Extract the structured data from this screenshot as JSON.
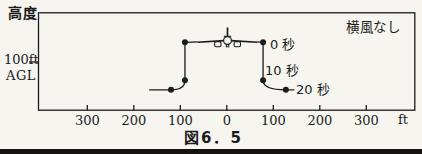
{
  "figure": {
    "caption": "図6．5",
    "y_axis_title": "高度",
    "y_ref_line1": "100ft",
    "y_ref_line2": "AGL",
    "annotation": "横風なし",
    "colors": {
      "ink": "#1c1c1c",
      "paper": "#f6f5f0"
    }
  },
  "chart_data": {
    "type": "line",
    "title": "図6．5",
    "subtitle": "横風なし",
    "ylabel": "高度 100ft AGL",
    "xlabel": "ft",
    "x_unit": "ft",
    "grid": false,
    "x_axis_ticks": [
      {
        "label": "300",
        "ft": -300
      },
      {
        "label": "200",
        "ft": -200
      },
      {
        "label": "100",
        "ft": -100
      },
      {
        "label": "0",
        "ft": 0
      },
      {
        "label": "100",
        "ft": 100
      },
      {
        "label": "200",
        "ft": 200
      },
      {
        "label": "300",
        "ft": 300
      }
    ],
    "y_ref_alt_ft": 100,
    "aircraft_position": {
      "x_ft": 0,
      "alt_ft": 141
    },
    "series": [
      {
        "name": "path-left",
        "points": [
          {
            "x_ft": -167,
            "alt_ft": 42
          },
          {
            "x_ft": -120,
            "alt_ft": 42,
            "dot": true
          },
          {
            "x_ft": -90,
            "alt_ft": 62,
            "dot": true,
            "curve": true,
            "ctrl": {
              "x_ft": -90,
              "alt_ft": 42
            }
          },
          {
            "x_ft": -90,
            "alt_ft": 141,
            "dot": true
          }
        ]
      },
      {
        "name": "path-right",
        "points": [
          {
            "x_ft": 78,
            "alt_ft": 141,
            "dot": true,
            "time_label": "0 秒"
          },
          {
            "x_ft": 78,
            "alt_ft": 62,
            "dot": true,
            "time_label": "10 秒"
          },
          {
            "x_ft": 127,
            "alt_ft": 42,
            "dot": true,
            "curve": true,
            "ctrl": {
              "x_ft": 78,
              "alt_ft": 42
            },
            "time_label": "20 秒"
          },
          {
            "x_ft": 145,
            "alt_ft": 42
          }
        ]
      }
    ],
    "time_labels": [
      "0 秒",
      "10 秒",
      "20 秒"
    ]
  }
}
